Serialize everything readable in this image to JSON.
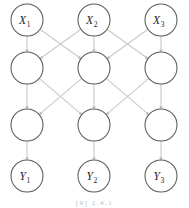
{
  "figure": {
    "caption": "[9]     2.4.1",
    "background_color": "#ffffff",
    "node_stroke_color": "#5a5a5a",
    "node_fill_color": "#ffffff",
    "edge_color": "#c9c9c9",
    "arrow_color": "#b4b4b4",
    "label_color": "#1c1c1c"
  },
  "chart_data": {
    "type": "diagram",
    "layout": "layered-directed-graph",
    "columns": 3,
    "rows": 4,
    "column_centers": [
      27,
      94,
      161
    ],
    "row_centers": [
      20,
      68,
      125,
      176
    ],
    "node_radius": 16,
    "layers": [
      {
        "index": 0,
        "name": "input-layer",
        "y": 20,
        "nodes": [
          {
            "id": "x1",
            "base": "X",
            "subscript": "1",
            "label": "X₁",
            "x": 27,
            "labeled": true
          },
          {
            "id": "x2",
            "base": "X",
            "subscript": "2",
            "label": "X₂",
            "x": 94,
            "labeled": true
          },
          {
            "id": "x3",
            "base": "X",
            "subscript": "3",
            "label": "X₃",
            "x": 161,
            "labeled": true
          }
        ]
      },
      {
        "index": 1,
        "name": "hidden-layer-1",
        "y": 68,
        "nodes": [
          {
            "id": "h11",
            "base": "",
            "subscript": "",
            "label": "",
            "x": 27,
            "labeled": false
          },
          {
            "id": "h12",
            "base": "",
            "subscript": "",
            "label": "",
            "x": 94,
            "labeled": false
          },
          {
            "id": "h13",
            "base": "",
            "subscript": "",
            "label": "",
            "x": 161,
            "labeled": false
          }
        ]
      },
      {
        "index": 2,
        "name": "hidden-layer-2",
        "y": 125,
        "nodes": [
          {
            "id": "h21",
            "base": "",
            "subscript": "",
            "label": "",
            "x": 27,
            "labeled": false
          },
          {
            "id": "h22",
            "base": "",
            "subscript": "",
            "label": "",
            "x": 94,
            "labeled": false
          },
          {
            "id": "h23",
            "base": "",
            "subscript": "",
            "label": "",
            "x": 161,
            "labeled": false
          }
        ]
      },
      {
        "index": 3,
        "name": "output-layer",
        "y": 176,
        "nodes": [
          {
            "id": "y1",
            "base": "Y",
            "subscript": "1",
            "label": "Y₁",
            "x": 27,
            "labeled": true
          },
          {
            "id": "y2",
            "base": "Y",
            "subscript": "2",
            "label": "Y₂",
            "x": 94,
            "labeled": true
          },
          {
            "id": "y3",
            "base": "Y",
            "subscript": "3",
            "label": "Y₃",
            "x": 161,
            "labeled": true
          }
        ]
      }
    ],
    "edges": [
      {
        "from": "x1",
        "to": "h11",
        "kind": "vertical"
      },
      {
        "from": "x2",
        "to": "h12",
        "kind": "vertical"
      },
      {
        "from": "x3",
        "to": "h13",
        "kind": "vertical"
      },
      {
        "from": "x1",
        "to": "h12",
        "kind": "diagonal"
      },
      {
        "from": "x2",
        "to": "h11",
        "kind": "diagonal"
      },
      {
        "from": "x2",
        "to": "h13",
        "kind": "diagonal"
      },
      {
        "from": "x3",
        "to": "h12",
        "kind": "diagonal"
      },
      {
        "from": "h11",
        "to": "h21",
        "kind": "vertical"
      },
      {
        "from": "h12",
        "to": "h22",
        "kind": "vertical"
      },
      {
        "from": "h13",
        "to": "h23",
        "kind": "vertical"
      },
      {
        "from": "h11",
        "to": "h22",
        "kind": "diagonal"
      },
      {
        "from": "h12",
        "to": "h21",
        "kind": "diagonal"
      },
      {
        "from": "h12",
        "to": "h23",
        "kind": "diagonal"
      },
      {
        "from": "h13",
        "to": "h22",
        "kind": "diagonal"
      },
      {
        "from": "h21",
        "to": "y1",
        "kind": "vertical"
      },
      {
        "from": "h22",
        "to": "y2",
        "kind": "vertical"
      },
      {
        "from": "h23",
        "to": "y3",
        "kind": "vertical"
      }
    ],
    "edge_style": {
      "directed": true,
      "arrowhead": "small-filled-triangle"
    }
  }
}
